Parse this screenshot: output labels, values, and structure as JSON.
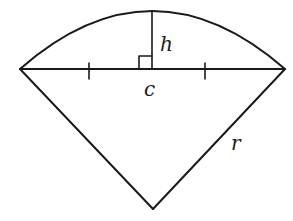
{
  "diagram": {
    "type": "circular-segment-geometry",
    "stroke_color": "#1a1a1a",
    "background_color": "#ffffff",
    "labels": {
      "height": "h",
      "chord": "c",
      "radius": "r"
    },
    "points": {
      "chord_left": [
        20,
        69
      ],
      "chord_right": [
        285,
        69
      ],
      "chord_midpoint": [
        152,
        69
      ],
      "arc_top": [
        152,
        11
      ],
      "center": [
        153,
        209
      ]
    },
    "markers": {
      "right_angle_at": "chord_midpoint",
      "equal_length_ticks": [
        89,
        205
      ]
    }
  }
}
